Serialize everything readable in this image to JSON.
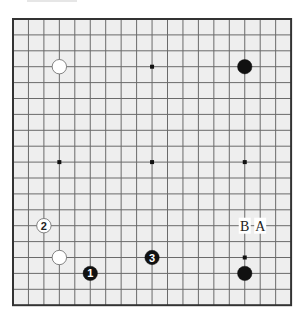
{
  "diagram": {
    "type": "go-board",
    "size": 19,
    "colors": {
      "board": "#eeeeee",
      "grid": "#6a6a6a",
      "border": "#333333",
      "black_stone": "#111111",
      "white_stone": "#ffffff",
      "white_stone_edge": "#666666"
    },
    "geometry": {
      "left": 13,
      "top": 19,
      "dx": 15.45,
      "dy": 15.9
    },
    "star_points": [
      [
        3,
        3
      ],
      [
        9,
        3
      ],
      [
        15,
        3
      ],
      [
        3,
        9
      ],
      [
        9,
        9
      ],
      [
        15,
        9
      ],
      [
        3,
        15
      ],
      [
        9,
        15
      ],
      [
        15,
        15
      ]
    ],
    "stones": [
      {
        "color": "white",
        "col": 3,
        "row": 3,
        "label": ""
      },
      {
        "color": "black",
        "col": 15,
        "row": 3,
        "label": ""
      },
      {
        "color": "white",
        "col": 3,
        "row": 15,
        "label": ""
      },
      {
        "color": "black",
        "col": 15,
        "row": 16,
        "label": ""
      },
      {
        "color": "black",
        "col": 5,
        "row": 16,
        "label": "1"
      },
      {
        "color": "white",
        "col": 2,
        "row": 13,
        "label": "2"
      },
      {
        "color": "black",
        "col": 9,
        "row": 15,
        "label": "3"
      }
    ],
    "markers": [
      {
        "col": 15,
        "row": 13,
        "text": "B"
      },
      {
        "col": 16,
        "row": 13,
        "text": "A"
      }
    ]
  }
}
